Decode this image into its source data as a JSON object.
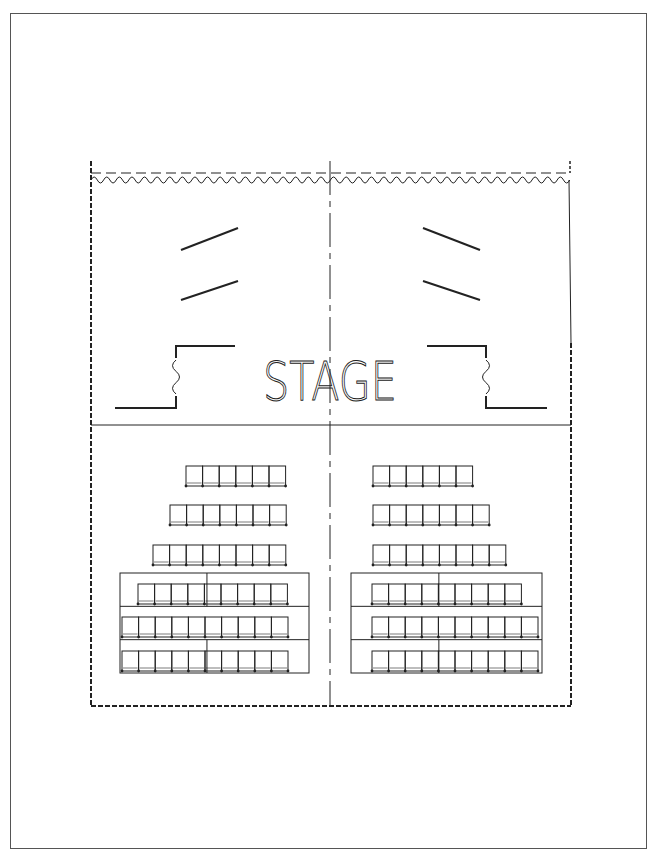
{
  "diagram": {
    "stage_label": "STAGE",
    "colors": {
      "line": "#222222",
      "frame": "#555555",
      "background": "#ffffff"
    }
  },
  "layout": {
    "room": {
      "left": 91,
      "right": 571,
      "top": 161,
      "bottom": 706
    },
    "center_x": 330,
    "stage_front_y": 425,
    "curtain": {
      "dash_y": 173,
      "wave_y": 180,
      "wave_period": 12.6
    },
    "right_wall_solid_until": 343
  },
  "stage": {
    "baffles_left": [
      {
        "x1": 181,
        "y1": 250,
        "x2": 238,
        "y2": 228
      },
      {
        "x1": 181,
        "y1": 300,
        "x2": 238,
        "y2": 281
      }
    ],
    "baffles_right": [
      {
        "x1": 423,
        "y1": 228,
        "x2": 480,
        "y2": 250
      },
      {
        "x1": 423,
        "y1": 281,
        "x2": 480,
        "y2": 300
      }
    ],
    "wing_left": {
      "outer_x": 115,
      "step_x": 176,
      "inner_x": 235,
      "top_y": 346,
      "bottom_y": 408
    },
    "wing_right": {
      "outer_x": 547,
      "step_x": 486,
      "inner_x": 427,
      "top_y": 346,
      "bottom_y": 408
    }
  },
  "seating": {
    "seat_width": 16.6,
    "seat_height": 20,
    "open_rows": [
      {
        "row": 1,
        "y": 466,
        "left": {
          "x": 186,
          "seats": 6
        },
        "right": {
          "x": 373,
          "seats": 6
        }
      },
      {
        "row": 2,
        "y": 505,
        "left": {
          "x": 170,
          "seats": 7
        },
        "right": {
          "x": 373,
          "seats": 7
        }
      },
      {
        "row": 3,
        "y": 545,
        "left": {
          "x": 153,
          "seats": 8
        },
        "right": {
          "x": 373,
          "seats": 8
        }
      }
    ],
    "risers": [
      {
        "side": "left",
        "x": 120,
        "y": 573,
        "w": 189,
        "h": 100
      },
      {
        "side": "right",
        "x": 351,
        "y": 573,
        "w": 191,
        "h": 100
      }
    ],
    "riser_rows": [
      {
        "row": 4,
        "y": 584,
        "left": {
          "x": 138,
          "seats": 9
        },
        "right": {
          "x": 372,
          "seats": 9
        }
      },
      {
        "row": 5,
        "y": 617,
        "left": {
          "x": 122,
          "seats": 10
        },
        "right": {
          "x": 372,
          "seats": 10
        }
      },
      {
        "row": 6,
        "y": 651,
        "left": {
          "x": 122,
          "seats": 10
        },
        "right": {
          "x": 372,
          "seats": 10
        }
      }
    ]
  }
}
